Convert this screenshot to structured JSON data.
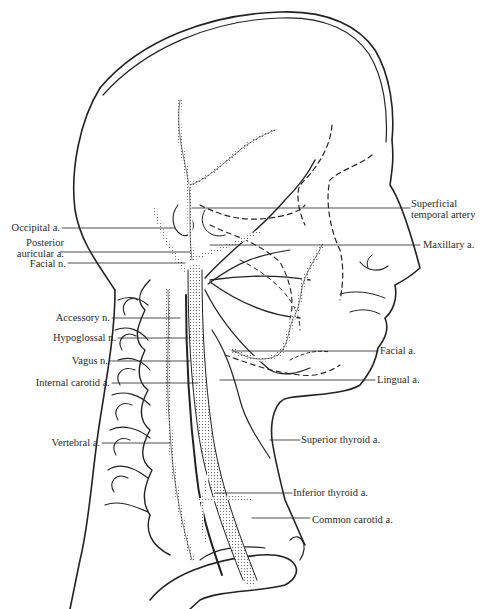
{
  "figure": {
    "left_labels": [
      {
        "id": "occipital",
        "text": "Occipital a.",
        "x": 0,
        "y": 222
      },
      {
        "id": "posterior-auricular",
        "text": "Posterior\nauricular a.",
        "x": 4,
        "y": 237
      },
      {
        "id": "facial-n",
        "text": "Facial n.",
        "x": 32,
        "y": 259
      },
      {
        "id": "accessory",
        "text": "Accessory n.",
        "x": 48,
        "y": 313
      },
      {
        "id": "hypoglossal",
        "text": "Hypoglossal n.",
        "x": 45,
        "y": 331
      },
      {
        "id": "vagus",
        "text": "Vagus n.",
        "x": 76,
        "y": 355
      },
      {
        "id": "internal-carotid",
        "text": "Internal carotid a.",
        "x": 31,
        "y": 377
      },
      {
        "id": "vertebral",
        "text": "Vertebral a.",
        "x": 45,
        "y": 437
      }
    ],
    "right_labels": [
      {
        "id": "superficial-temporal",
        "text": "Superficial\ntemporal artery",
        "x": 410,
        "y": 199
      },
      {
        "id": "maxillary",
        "text": "Maxillary a.",
        "x": 422,
        "y": 240
      },
      {
        "id": "facial-a",
        "text": "Facial a.",
        "x": 379,
        "y": 347
      },
      {
        "id": "lingual",
        "text": "Lingual a.",
        "x": 376,
        "y": 377
      },
      {
        "id": "superior-thyroid",
        "text": "Superior thyroid a.",
        "x": 301,
        "y": 434
      },
      {
        "id": "inferior-thyroid",
        "text": "Inferior thyroid a.",
        "x": 293,
        "y": 488
      },
      {
        "id": "common-carotid",
        "text": "Common carotid a.",
        "x": 311,
        "y": 515
      }
    ]
  }
}
